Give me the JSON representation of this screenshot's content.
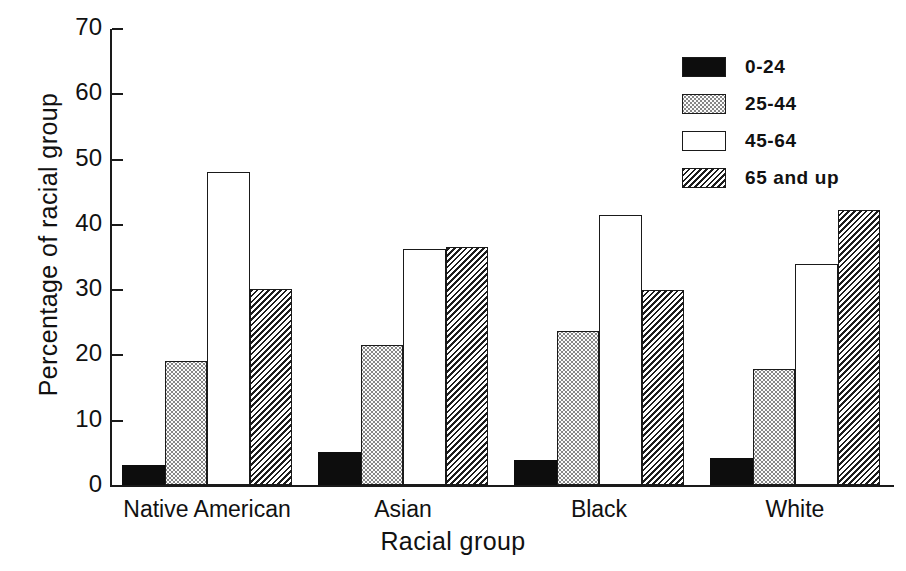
{
  "chart_data": {
    "type": "bar",
    "title": "",
    "xlabel": "Racial group",
    "ylabel": "Percentage of racial group",
    "categories": [
      "Native American",
      "Asian",
      "Black",
      "White"
    ],
    "series": [
      {
        "name": "0-24",
        "fill": "solid",
        "values": [
          3.0,
          5.1,
          3.8,
          4.1
        ]
      },
      {
        "name": "25-44",
        "fill": "stipple",
        "values": [
          19.0,
          21.4,
          23.6,
          17.8
        ]
      },
      {
        "name": "45-64",
        "fill": "empty",
        "values": [
          48.0,
          36.2,
          41.4,
          33.9
        ]
      },
      {
        "name": "65 and up",
        "fill": "hatch",
        "values": [
          30.0,
          36.5,
          29.8,
          42.2
        ]
      }
    ],
    "ylim": [
      0,
      70
    ],
    "yticks": [
      0,
      10,
      20,
      30,
      40,
      50,
      60,
      70
    ],
    "ytick_labels": [
      "0",
      "10",
      "20",
      "30",
      "40",
      "50",
      "60",
      "70"
    ],
    "grid": false,
    "legend_position": "top-right",
    "colors": {
      "axis": "#1a1a1a",
      "text": "#111111",
      "bar_solid": "#0d0d0d",
      "bar_empty": "#ffffff",
      "background": "#ffffff"
    }
  },
  "legend": {
    "entries": [
      {
        "label": "0-24"
      },
      {
        "label": "25-44"
      },
      {
        "label": "45-64"
      },
      {
        "label": "65 and up"
      }
    ]
  },
  "axes": {
    "y_title": "Percentage of racial group",
    "x_title": "Racial group"
  }
}
